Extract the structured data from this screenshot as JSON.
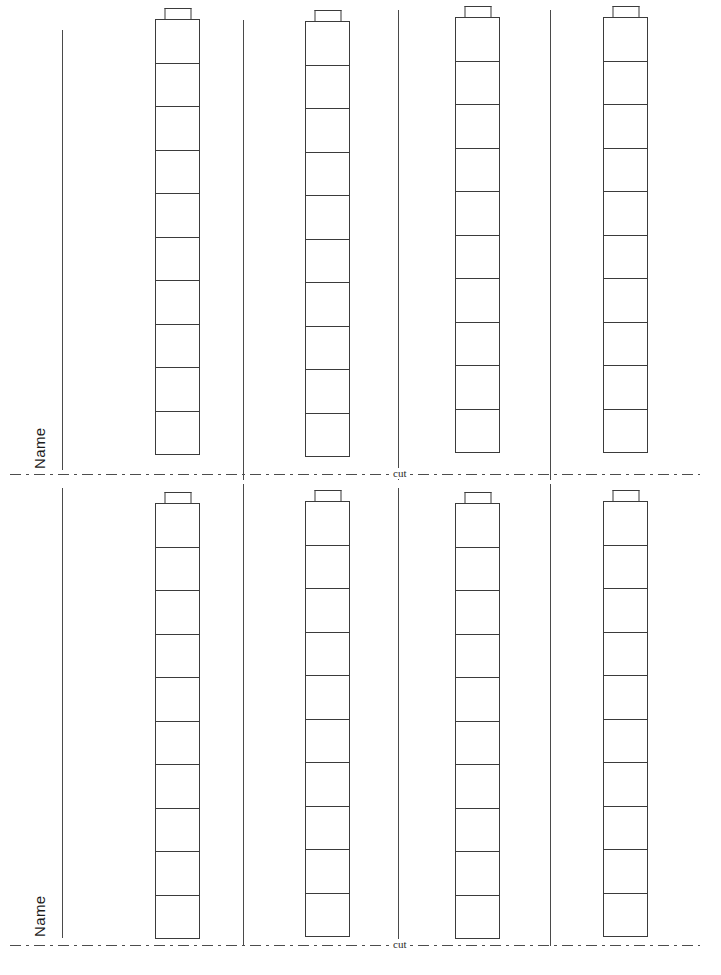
{
  "page": {
    "background_color": "#ffffff",
    "ink_color": "#3b3b3b",
    "width": 721,
    "height": 975
  },
  "halves": [
    {
      "id": "top",
      "name_label": "Name",
      "name_rule": {
        "x": 62,
        "y": 30,
        "height": 440
      },
      "name_label_pos": {
        "x": 48,
        "y": 452
      },
      "separators": [
        {
          "x": 243,
          "y": 20,
          "height": 460
        },
        {
          "x": 398,
          "y": 10,
          "height": 470
        },
        {
          "x": 550,
          "y": 10,
          "height": 470
        }
      ],
      "towers": [
        {
          "x": 155,
          "y": 8,
          "blocks": 10
        },
        {
          "x": 305,
          "y": 10,
          "blocks": 10
        },
        {
          "x": 455,
          "y": 6,
          "blocks": 10
        },
        {
          "x": 603,
          "y": 6,
          "blocks": 10
        }
      ],
      "cut": {
        "label": "cut",
        "y": 474,
        "x_start": 10,
        "x_end": 700,
        "label_x": 389
      }
    },
    {
      "id": "bottom",
      "name_label": "Name",
      "name_rule": {
        "x": 62,
        "y": 488,
        "height": 450
      },
      "name_label_pos": {
        "x": 48,
        "y": 920
      },
      "separators": [
        {
          "x": 243,
          "y": 484,
          "height": 462
        },
        {
          "x": 398,
          "y": 488,
          "height": 458
        },
        {
          "x": 550,
          "y": 484,
          "height": 462
        }
      ],
      "towers": [
        {
          "x": 155,
          "y": 492,
          "blocks": 10
        },
        {
          "x": 305,
          "y": 490,
          "blocks": 10
        },
        {
          "x": 455,
          "y": 492,
          "blocks": 10
        },
        {
          "x": 603,
          "y": 490,
          "blocks": 10
        }
      ],
      "cut": {
        "label": "cut",
        "y": 945,
        "x_start": 10,
        "x_end": 700,
        "label_x": 389
      }
    }
  ],
  "legend": {
    "tower_block_count": 10,
    "towers_per_half": 4,
    "total_towers": 8,
    "stud_shape": "rectangular-nub"
  }
}
